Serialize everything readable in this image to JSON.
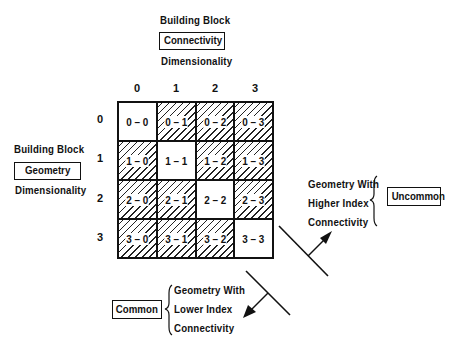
{
  "top_label": {
    "line1": "Building Block",
    "boxed": "Connectivity",
    "line3": "Dimensionality"
  },
  "left_label": {
    "line1": "Building Block",
    "boxed": "Geometry",
    "line3": "Dimensionality"
  },
  "column_headers": [
    "0",
    "1",
    "2",
    "3"
  ],
  "row_headers": [
    "0",
    "1",
    "2",
    "3"
  ],
  "cells": [
    [
      {
        "label": "0 – 0",
        "hatched": false
      },
      {
        "label": "0 – 1",
        "hatched": true
      },
      {
        "label": "0 – 2",
        "hatched": true
      },
      {
        "label": "0 – 3",
        "hatched": true
      }
    ],
    [
      {
        "label": "1 – 0",
        "hatched": true
      },
      {
        "label": "1 – 1",
        "hatched": false
      },
      {
        "label": "1 – 2",
        "hatched": true
      },
      {
        "label": "1 – 3",
        "hatched": true
      }
    ],
    [
      {
        "label": "2 – 0",
        "hatched": true
      },
      {
        "label": "2 – 1",
        "hatched": true
      },
      {
        "label": "2 – 2",
        "hatched": false
      },
      {
        "label": "2 – 3",
        "hatched": true
      }
    ],
    [
      {
        "label": "3 – 0",
        "hatched": true
      },
      {
        "label": "3 – 1",
        "hatched": true
      },
      {
        "label": "3 – 2",
        "hatched": true
      },
      {
        "label": "3 – 3",
        "hatched": false
      }
    ]
  ],
  "upper_annotation": {
    "lines": [
      "Geometry With",
      "Higher Index",
      "Connectivity"
    ],
    "boxed": "Uncommon"
  },
  "lower_annotation": {
    "lines": [
      "Geometry With",
      "Lower Index",
      "Connectivity"
    ],
    "boxed": "Common"
  }
}
